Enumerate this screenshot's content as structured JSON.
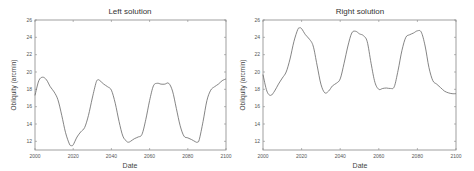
{
  "chart_data": [
    {
      "type": "line",
      "title": "Left solution",
      "xlabel": "Date",
      "ylabel": "Obliquity (arcmin)",
      "xlim": [
        2000,
        2100
      ],
      "ylim": [
        11,
        26
      ],
      "xticks": [
        2000,
        2020,
        2040,
        2060,
        2080,
        2100
      ],
      "yticks": [
        12,
        14,
        16,
        18,
        20,
        22,
        24,
        26
      ],
      "grid": false,
      "x": [
        2000,
        2002,
        2004,
        2006,
        2008,
        2010,
        2012,
        2014,
        2016,
        2018,
        2019,
        2020,
        2022,
        2024,
        2026,
        2028,
        2030,
        2032,
        2033,
        2034,
        2036,
        2038,
        2040,
        2042,
        2044,
        2046,
        2048,
        2049,
        2050,
        2052,
        2054,
        2056,
        2058,
        2060,
        2062,
        2064,
        2066,
        2068,
        2070,
        2072,
        2074,
        2076,
        2078,
        2080,
        2082,
        2084,
        2085,
        2086,
        2088,
        2090,
        2092,
        2094,
        2096,
        2098,
        2100
      ],
      "y": [
        17.3,
        19.0,
        19.4,
        19.1,
        18.3,
        17.7,
        16.8,
        15.0,
        13.0,
        11.7,
        11.5,
        11.6,
        12.5,
        13.1,
        13.6,
        15.0,
        17.0,
        18.8,
        19.1,
        19.0,
        18.6,
        18.3,
        17.9,
        16.4,
        14.3,
        12.6,
        12.0,
        11.9,
        12.0,
        12.3,
        12.5,
        12.8,
        14.5,
        16.7,
        18.4,
        18.7,
        18.6,
        18.6,
        18.7,
        17.8,
        15.8,
        13.8,
        12.6,
        12.4,
        12.2,
        11.95,
        11.9,
        12.2,
        14.3,
        16.7,
        17.9,
        18.3,
        18.6,
        19.0,
        19.2
      ]
    },
    {
      "type": "line",
      "title": "Right solution",
      "xlabel": "Date",
      "ylabel": "Obliquity (arcmin)",
      "xlim": [
        2000,
        2100
      ],
      "ylim": [
        11,
        26
      ],
      "xticks": [
        2000,
        2020,
        2040,
        2060,
        2080,
        2100
      ],
      "yticks": [
        12,
        14,
        16,
        18,
        20,
        22,
        24,
        26
      ],
      "grid": false,
      "x": [
        2000,
        2002,
        2004,
        2006,
        2008,
        2010,
        2012,
        2014,
        2016,
        2018,
        2019,
        2020,
        2022,
        2024,
        2026,
        2028,
        2030,
        2032,
        2034,
        2036,
        2038,
        2040,
        2042,
        2044,
        2046,
        2048,
        2050,
        2052,
        2054,
        2056,
        2058,
        2060,
        2062,
        2064,
        2066,
        2068,
        2070,
        2072,
        2074,
        2076,
        2078,
        2080,
        2082,
        2084,
        2086,
        2088,
        2090,
        2092,
        2094,
        2096,
        2098,
        2100
      ],
      "y": [
        19.7,
        17.8,
        17.3,
        17.8,
        18.6,
        19.3,
        20.0,
        21.5,
        23.5,
        24.9,
        25.1,
        25.0,
        24.3,
        23.8,
        23.0,
        20.8,
        18.6,
        17.6,
        17.8,
        18.4,
        18.7,
        19.2,
        21.0,
        23.0,
        24.5,
        24.7,
        24.4,
        24.2,
        23.5,
        21.0,
        18.8,
        18.0,
        18.1,
        18.15,
        18.1,
        18.3,
        20.2,
        22.5,
        24.0,
        24.3,
        24.5,
        24.75,
        24.6,
        23.0,
        20.5,
        19.0,
        18.6,
        18.2,
        17.8,
        17.6,
        17.5,
        17.5
      ]
    }
  ],
  "plots": [
    {
      "title": "Left solution",
      "xlabel": "Date",
      "ylabel": "Obliquity (arcmin)",
      "xticks": [
        "2000",
        "2020",
        "2040",
        "2060",
        "2080",
        "2100"
      ],
      "yticks": [
        "12",
        "14",
        "16",
        "18",
        "20",
        "22",
        "24",
        "26"
      ]
    },
    {
      "title": "Right solution",
      "xlabel": "Date",
      "ylabel": "Obliquity (arcmin)",
      "xticks": [
        "2000",
        "2020",
        "2040",
        "2060",
        "2080",
        "2100"
      ],
      "yticks": [
        "12",
        "14",
        "16",
        "18",
        "20",
        "22",
        "24",
        "26"
      ]
    }
  ]
}
